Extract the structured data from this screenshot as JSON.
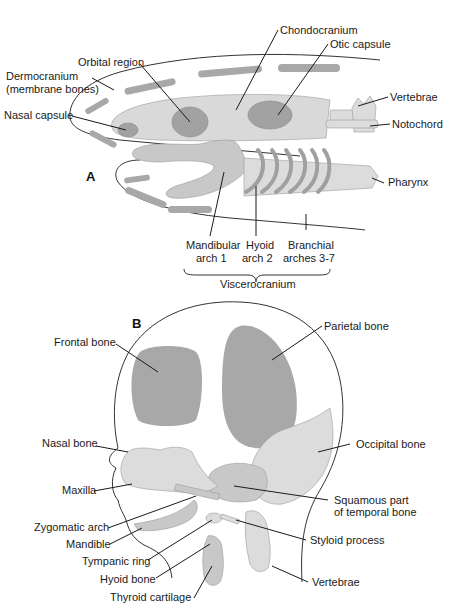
{
  "figure": {
    "caption_cutoff": "",
    "panel_a": {
      "label": "A",
      "labels": {
        "chondocranium": "Chondocranium",
        "otic_capsule": "Otic capsule",
        "orbital_region": "Orbital region",
        "dermocranium_1": "Dermocranium",
        "dermocranium_2": "(membrane bones)",
        "nasal_capsule": "Nasal capsule",
        "vertebrae": "Vertebrae",
        "notochord": "Notochord",
        "pharynx": "Pharynx",
        "mandibular_1": "Mandibular",
        "mandibular_2": "arch 1",
        "hyoid_1": "Hyoid",
        "hyoid_2": "arch 2",
        "branchial_1": "Branchial",
        "branchial_2": "arches 3-7",
        "viscerocranium": "Viscerocranium"
      }
    },
    "panel_b": {
      "label": "B",
      "labels": {
        "frontal_bone": "Frontal bone",
        "parietal_bone": "Parietal bone",
        "nasal_bone": "Nasal bone",
        "occipital_bone": "Occipital bone",
        "maxilla": "Maxilla",
        "squamous_1": "Squamous part",
        "squamous_2": "of temporal bone",
        "zygomatic_arch": "Zygomatic arch",
        "mandible": "Mandible",
        "styloid_process": "Styloid process",
        "tympanic_ring": "Tympanic ring",
        "hyoid_bone": "Hyoid bone",
        "vertebrae": "Vertebrae",
        "thyroid_cartilage": "Thyroid cartilage"
      }
    },
    "colors": {
      "dark_bone": "#a6a6a6",
      "light_cartilage": "#d9d9d9",
      "outline": "#333333",
      "text": "#1a1a1a"
    }
  }
}
